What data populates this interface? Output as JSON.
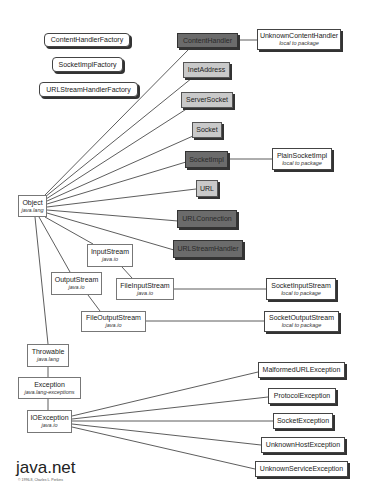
{
  "diagram": {
    "title": "java.net",
    "copyright": "© 1996-8, Charles L. Perkins",
    "factories": [
      {
        "label": "ContentHandlerFactory"
      },
      {
        "label": "SocketImplFactory"
      },
      {
        "label": "URLStreamHandlerFactory"
      }
    ],
    "classes": {
      "content_handler": {
        "label": "ContentHandler"
      },
      "unknown_content_handler": {
        "label": "UnknownContentHandler",
        "pkg": "local to package"
      },
      "inet_address": {
        "label": "InetAddress"
      },
      "server_socket": {
        "label": "ServerSocket"
      },
      "socket": {
        "label": "Socket"
      },
      "socket_impl": {
        "label": "SocketImpl"
      },
      "plain_socket_impl": {
        "label": "PlainSocketImpl",
        "pkg": "local to package"
      },
      "url": {
        "label": "URL"
      },
      "url_connection": {
        "label": "URLConnection"
      },
      "url_stream_handler": {
        "label": "URLStreamHandler"
      },
      "object": {
        "label": "Object",
        "pkg": "java.lang"
      },
      "input_stream": {
        "label": "InputStream",
        "pkg": "java.io"
      },
      "output_stream": {
        "label": "OutputStream",
        "pkg": "java.io"
      },
      "file_input_stream": {
        "label": "FileInputStream",
        "pkg": "java.io"
      },
      "file_output_stream": {
        "label": "FileOutputStream",
        "pkg": "java.io"
      },
      "socket_input_stream": {
        "label": "SocketInputStream",
        "pkg": "local to package"
      },
      "socket_output_stream": {
        "label": "SocketOutputStream",
        "pkg": "local to package"
      },
      "throwable": {
        "label": "Throwable",
        "pkg": "java.lang"
      },
      "exception": {
        "label": "Exception",
        "pkg": "java.lang-exceptions"
      },
      "io_exception": {
        "label": "IOException",
        "pkg": "java.io"
      }
    },
    "exceptions": [
      {
        "label": "MalformedURLException"
      },
      {
        "label": "ProtocolException"
      },
      {
        "label": "SocketException"
      },
      {
        "label": "UnknownHostException"
      },
      {
        "label": "UnknownServiceException"
      }
    ],
    "colors": {
      "dark_class": "#6b6b6b",
      "light_class": "#c9c9c9",
      "line": "#333333"
    }
  }
}
